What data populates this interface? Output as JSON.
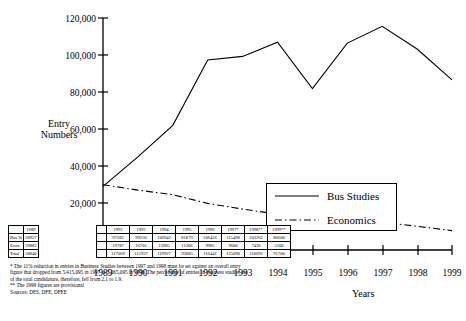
{
  "chart_data": {
    "type": "line",
    "title": "",
    "xlabel": "Years",
    "ylabel": "Entry Numbers",
    "grid": false,
    "legend_position": "inside-right",
    "ylim": [
      0,
      120000
    ],
    "yticks": [
      "20,000",
      "40,000",
      "60,000",
      "80,000",
      "100,000",
      "120,000"
    ],
    "ytick_values": [
      20000,
      40000,
      60000,
      80000,
      100000,
      120000
    ],
    "categories": [
      "1989",
      "1990",
      "1991",
      "1992",
      "1993",
      "1994",
      "1995",
      "1996",
      "1997",
      "1998",
      "1999"
    ],
    "xtick_labels": [
      "1989",
      "1990",
      "1991",
      "1992",
      "1993",
      "1994",
      "1995",
      "1996",
      "1997",
      "1998",
      "1999"
    ],
    "series": [
      {
        "name": "Bus Studies",
        "style": "solid",
        "values": [
          28957,
          45000,
          62000,
          97282,
          99236,
          106942,
          81879,
          106456,
          115498,
          103262,
          86600
        ]
      },
      {
        "name": "Economics",
        "style": "dash-dot",
        "values": [
          29883,
          27000,
          24500,
          19787,
          16701,
          13985,
          11206,
          9985,
          9600,
          7430,
          5100
        ]
      }
    ]
  },
  "axis": {
    "y_label_line1": "Entry",
    "y_label_line2": "Numbers",
    "x_label": "Years"
  },
  "legend": {
    "items": [
      {
        "label": "Bus Studies",
        "style": "solid"
      },
      {
        "label": "Economics",
        "style": "dash-dot"
      }
    ]
  },
  "table_1989": {
    "header": [
      "",
      "1989"
    ],
    "rows": [
      {
        "label": "Bus St",
        "values": [
          "28957"
        ]
      },
      {
        "label": "Econ",
        "values": [
          "29883"
        ]
      },
      {
        "label": "Total",
        "values": [
          "58840"
        ]
      }
    ]
  },
  "table_main": {
    "header": [
      "",
      "",
      "1992",
      "1993",
      "1994",
      "1995",
      "1996",
      "1997*",
      "1998**",
      "1999**"
    ],
    "rows": [
      {
        "label": "",
        "values": [
          "",
          "97282",
          "99236",
          "106942",
          "81879",
          "106456",
          "115498",
          "103262",
          "86600"
        ]
      },
      {
        "label": "",
        "values": [
          "",
          "19787",
          "16701",
          "13985",
          "11206",
          "9985",
          "9600",
          "7430",
          "5100"
        ]
      },
      {
        "label": "",
        "values": [
          "",
          "117069",
          "115937",
          "119927",
          "93085",
          "116441",
          "125098",
          "110692",
          "91700"
        ]
      }
    ]
  },
  "footnotes": [
    "* The 11% reduction in entries in Business Studies between 1997 and 1998 must be set against an overall entry",
    "figure that dropped from 5,415,095 in 1997 to 5,065,095 in 1998.  The percentage of entries in business studies out",
    "of the total candidature, therefore, fell from 2.1 to 1.9.",
    "** The 1999 figures are provisional",
    "Sources: DES, DFE, DFEE"
  ],
  "colors": {
    "axis": "#000000",
    "series": "#000000",
    "background": "#ffffff"
  }
}
